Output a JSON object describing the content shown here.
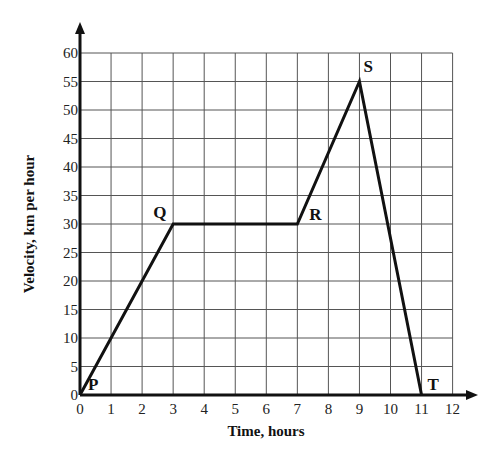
{
  "chart_data": {
    "type": "line",
    "title": "",
    "xlabel": "Time, hours",
    "ylabel": "Velocity, km per hour",
    "xlim": [
      0,
      12
    ],
    "ylim": [
      0,
      60
    ],
    "x_ticks": [
      0,
      1,
      2,
      3,
      4,
      5,
      6,
      7,
      8,
      9,
      10,
      11,
      12
    ],
    "y_ticks": [
      0,
      5,
      10,
      15,
      20,
      25,
      30,
      35,
      40,
      45,
      50,
      55,
      60
    ],
    "grid": true,
    "legend": null,
    "series": [
      {
        "name": "velocity",
        "points": [
          {
            "label": "P",
            "x": 0,
            "y": 0
          },
          {
            "label": "Q",
            "x": 3,
            "y": 30
          },
          {
            "label": "R",
            "x": 7,
            "y": 30
          },
          {
            "label": "S",
            "x": 9,
            "y": 55
          },
          {
            "label": "T",
            "x": 11,
            "y": 0
          }
        ]
      }
    ]
  }
}
